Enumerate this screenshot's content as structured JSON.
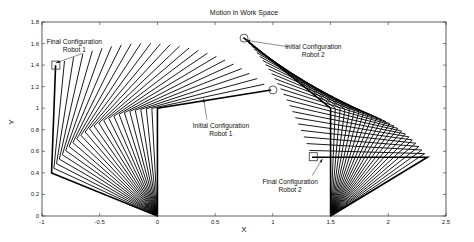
{
  "chart_data": {
    "type": "line",
    "title": "Motion in Work Space",
    "xlabel": "X",
    "ylabel": "Y",
    "xlim": [
      -1,
      2.5
    ],
    "ylim": [
      0,
      1.8
    ],
    "grid": false,
    "legend": null,
    "xticks": [
      -1,
      -0.5,
      0,
      0.5,
      1,
      1.5,
      2,
      2.5
    ],
    "xtick_labels": [
      "-1",
      "-0.5",
      "0",
      "0.5",
      "1",
      "1.5",
      "2",
      "2.5"
    ],
    "yticks": [
      0,
      0.2,
      0.4,
      0.6,
      0.8,
      1,
      1.2,
      1.4,
      1.6,
      1.8
    ],
    "ytick_labels": [
      "0",
      "0.2",
      "0.4",
      "0.6",
      "0.8",
      "1",
      "1.2",
      "1.4",
      "1.6",
      "1.8"
    ],
    "series": [
      {
        "name": "Robot 1",
        "base": [
          0,
          0
        ],
        "link_lengths": [
          1.0,
          1.0
        ],
        "frames": 25,
        "initial": {
          "joint1": [
            0,
            1.0
          ],
          "end_effector": [
            1.0,
            1.17
          ]
        },
        "final": {
          "joint1": [
            -0.92,
            0.4
          ],
          "end_effector": [
            -0.88,
            1.4
          ]
        },
        "link1_angle_deg": [
          90,
          156.5
        ],
        "link2_angle_deg": [
          9.7,
          88.0
        ]
      },
      {
        "name": "Robot 2",
        "base": [
          1.5,
          0
        ],
        "link_lengths": [
          1.0,
          1.0
        ],
        "frames": 25,
        "initial": {
          "joint1": [
            1.5,
            1.0
          ],
          "end_effector": [
            0.75,
            1.65
          ]
        },
        "final": {
          "joint1": [
            2.35,
            0.55
          ],
          "end_effector": [
            1.35,
            0.55
          ]
        },
        "link1_angle_deg": [
          90,
          33.0
        ],
        "link2_angle_deg": [
          139.0,
          180.0
        ]
      }
    ],
    "annotations": [
      {
        "text": [
          "Final Configuration",
          "Robot 1"
        ],
        "text_pos": [
          -0.72,
          1.6
        ],
        "arrow_to": [
          -0.88,
          1.42
        ],
        "marker": "square",
        "marker_at": [
          -0.88,
          1.4
        ]
      },
      {
        "text": [
          "Initial Configuration",
          "Robot 1"
        ],
        "text_pos": [
          0.55,
          0.82
        ],
        "arrow_to": [
          0.4,
          1.09
        ],
        "marker": "circle",
        "marker_at": [
          1.0,
          1.17
        ]
      },
      {
        "text": [
          "Initial Configuration",
          "Robot 2"
        ],
        "text_pos": [
          1.35,
          1.55
        ],
        "arrow_to": [
          0.77,
          1.63
        ],
        "marker": "circle",
        "marker_at": [
          0.75,
          1.65
        ]
      },
      {
        "text": [
          "Final Configuration",
          "Robot 2"
        ],
        "text_pos": [
          1.15,
          0.3
        ],
        "arrow_to": [
          1.43,
          0.53
        ],
        "marker": "square",
        "marker_at": [
          1.35,
          0.55
        ]
      }
    ]
  },
  "layout": {
    "plot_px": {
      "left": 42,
      "right": 446,
      "top": 22,
      "bottom": 216
    }
  }
}
